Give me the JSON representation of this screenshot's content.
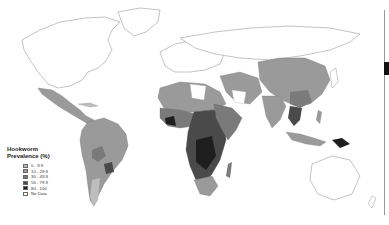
{
  "map": {
    "title_line1": "Hookworm",
    "title_line2": "Prevalence (%)",
    "legend": [
      {
        "label": "0 - 9.9",
        "color": "#bdbdbd"
      },
      {
        "label": "10 - 29.9",
        "color": "#9a9a9a"
      },
      {
        "label": "30 - 49.9",
        "color": "#7a7a7a"
      },
      {
        "label": "50 - 79.9",
        "color": "#4a4a4a"
      },
      {
        "label": "80 - 100",
        "color": "#1e1e1e"
      },
      {
        "label": "No Data",
        "color": "#ffffff"
      }
    ],
    "outline_color": "#9a9a9a"
  }
}
